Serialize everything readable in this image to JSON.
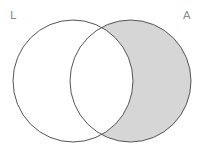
{
  "diagram": {
    "type": "venn",
    "labels": {
      "left": "L",
      "right": "A"
    },
    "shaded_region": "A minus L",
    "colors": {
      "fill": "#d6d6d6",
      "stroke": "#555555",
      "label": "#888888"
    }
  }
}
